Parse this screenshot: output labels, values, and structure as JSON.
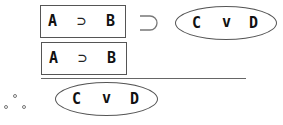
{
  "premise1": {
    "antecedent": {
      "left": "A",
      "op": "⊃",
      "right": "B"
    },
    "main_op": "⊃",
    "consequent": {
      "left": "C",
      "op": "v",
      "right": "D"
    }
  },
  "premise2": {
    "left": "A",
    "op": "⊃",
    "right": "B"
  },
  "conclusion": {
    "therefore": "∴",
    "left": "C",
    "op": "v",
    "right": "D"
  }
}
